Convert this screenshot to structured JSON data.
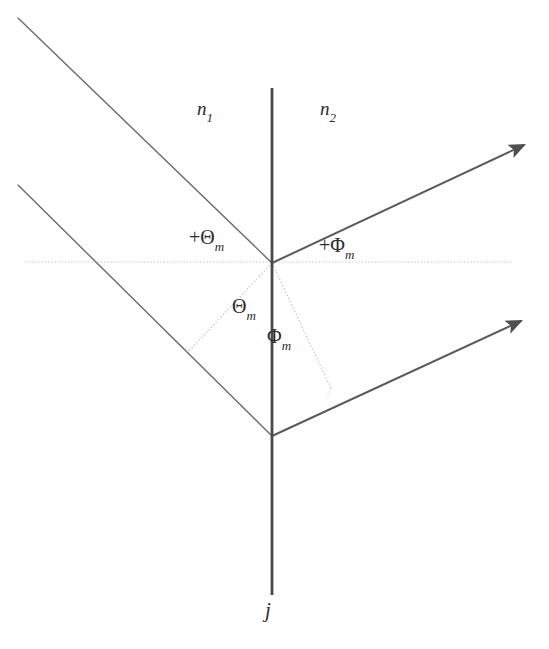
{
  "figure": {
    "type": "optics-refraction-diagram",
    "background_color": "#ffffff",
    "line_color": "#555555",
    "interface_color": "#4a4a4a",
    "dotted_color": "#b9b9b9",
    "text_color": "#2b2b2b",
    "canvas": {
      "width": 549,
      "height": 649
    }
  },
  "labels": {
    "medium_left": {
      "base": "n",
      "sub": "1"
    },
    "medium_right": {
      "base": "n",
      "sub": "2"
    },
    "angle_incidence_upper": {
      "sign": "+",
      "symbol": "Θ",
      "sub": "m"
    },
    "angle_refraction_upper": {
      "sign": "+",
      "symbol": "Φ",
      "sub": "m"
    },
    "angle_incidence_lower": {
      "symbol": "Θ",
      "sub": "m"
    },
    "angle_refraction_lower": {
      "symbol": "Φ",
      "sub": "m"
    },
    "current_axis": {
      "base": "j"
    }
  },
  "geometry": {
    "origin": {
      "x": 272,
      "y": 263
    },
    "lower_vertex": {
      "x": 272,
      "y": 436
    },
    "interface_line": {
      "x": 272,
      "y1": 88,
      "y2": 595
    },
    "optical_axis_dotted": {
      "x1": 25,
      "x2": 512,
      "y": 262
    },
    "incident_ray_upper": {
      "x1": 18,
      "y1": 18,
      "x2": 272,
      "y2": 263
    },
    "incident_ray_lower": {
      "x1": 18,
      "y1": 185,
      "x2": 272,
      "y2": 436
    },
    "refracted_ray_upper": {
      "x1": 272,
      "y1": 263,
      "x2": 530,
      "y2": 142
    },
    "refracted_ray_lower": {
      "x1": 272,
      "y1": 436,
      "x2": 527,
      "y2": 318
    },
    "theta_guide": {
      "x1": 272,
      "y1": 263,
      "x2": 189,
      "y2": 351
    },
    "phi_guide": {
      "x1": 272,
      "y1": 263,
      "x2": 331,
      "y2": 388
    }
  }
}
